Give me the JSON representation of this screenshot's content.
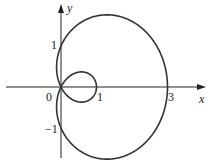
{
  "chart_data": {
    "type": "line",
    "title": "",
    "curve": "limaçon with inner loop, r = 1 + 2cos(θ)",
    "xlabel": "x",
    "ylabel": "y",
    "x_ticks": [
      {
        "value": 0,
        "label": "0"
      },
      {
        "value": 1,
        "label": "1"
      },
      {
        "value": 3,
        "label": "3"
      }
    ],
    "y_ticks": [
      {
        "value": 1,
        "label": "1"
      },
      {
        "value": -1,
        "label": "−1"
      }
    ],
    "xlim": [
      -1.7,
      4.2
    ],
    "ylim": [
      -1.8,
      2.1
    ],
    "grid": false,
    "legend": null,
    "key_points": [
      {
        "x": 3,
        "y": 0
      },
      {
        "x": 1,
        "y": 0
      },
      {
        "x": 0,
        "y": 0
      },
      {
        "x": 0,
        "y": 1
      },
      {
        "x": 0,
        "y": -1
      }
    ]
  },
  "labels": {
    "x_axis": "x",
    "y_axis": "y",
    "origin": "0",
    "x_one": "1",
    "x_three": "3",
    "y_one": "1",
    "y_neg_one": "−1"
  }
}
